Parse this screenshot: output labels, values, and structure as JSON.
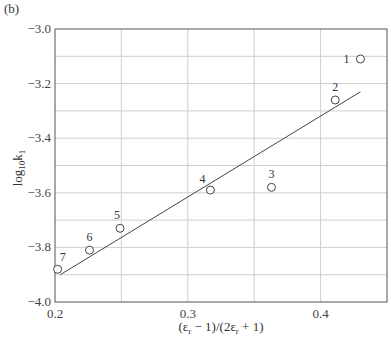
{
  "panel_label": "(b)",
  "chart_data": {
    "type": "scatter",
    "title": "",
    "xlabel": "(εr − 1)/(2εr + 1)",
    "ylabel": "log10 k1",
    "xlim": [
      0.2,
      0.45
    ],
    "ylim": [
      -4.0,
      -3.0
    ],
    "x_ticks": [
      0.2,
      0.3,
      0.4
    ],
    "x_tick_labels": [
      "0.2",
      "0.3",
      "0.4"
    ],
    "y_ticks": [
      -3.0,
      -3.2,
      -3.4,
      -3.6,
      -3.8,
      -4.0
    ],
    "y_tick_labels": [
      "−3.0",
      "−3.2",
      "−3.4",
      "−3.6",
      "−3.8",
      "−4.0"
    ],
    "grid": {
      "x_step": 0.05,
      "y_step": 0.1,
      "on": true
    },
    "legend": null,
    "series": [
      {
        "name": "data points",
        "marker": "open-circle",
        "points": [
          {
            "label": "1",
            "x": 0.43,
            "y": -3.11
          },
          {
            "label": "2",
            "x": 0.411,
            "y": -3.26
          },
          {
            "label": "3",
            "x": 0.363,
            "y": -3.58
          },
          {
            "label": "4",
            "x": 0.317,
            "y": -3.59
          },
          {
            "label": "5",
            "x": 0.249,
            "y": -3.73
          },
          {
            "label": "6",
            "x": 0.226,
            "y": -3.81
          },
          {
            "label": "7",
            "x": 0.202,
            "y": -3.88
          }
        ]
      },
      {
        "name": "linear fit",
        "type": "line",
        "points": [
          {
            "x": 0.204,
            "y": -3.9
          },
          {
            "x": 0.43,
            "y": -3.23
          }
        ]
      }
    ]
  }
}
